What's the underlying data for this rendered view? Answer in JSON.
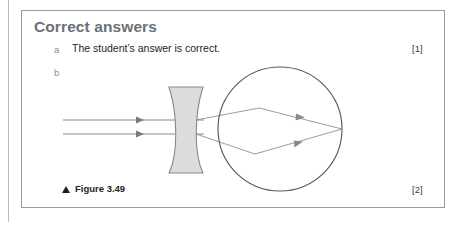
{
  "page": {
    "width": 463,
    "height": 232,
    "background": "#ffffff",
    "margin_rule_color": "#b9b9b9"
  },
  "card": {
    "title": "Correct answers",
    "title_color": "#6b7078",
    "border_color": "#9a9a9a",
    "items": [
      {
        "letter": "a",
        "text": "The student’s answer is correct.",
        "marks": "[1]"
      },
      {
        "letter": "b",
        "text": "",
        "marks": "[2]"
      }
    ]
  },
  "figure": {
    "caption_prefix_icon": "triangle-up-icon",
    "caption": "Figure 3.49",
    "marks": "[2]",
    "stroke_color": "#6f6f6f",
    "lens_fill": "#dcdcdc",
    "lens_stroke": "#8a8a8a",
    "eye_stroke": "#595959",
    "ray_count": 2,
    "lens_type": "biconcave-diverging",
    "eye_shape": "circle"
  }
}
